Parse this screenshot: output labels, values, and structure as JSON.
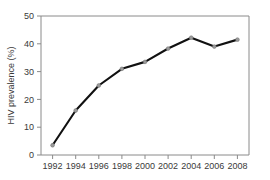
{
  "chart_data": {
    "type": "line",
    "title": "",
    "xlabel": "",
    "ylabel": "HIV prevalence (%)",
    "categories": [
      "1992",
      "1994",
      "1996",
      "1998",
      "2000",
      "2002",
      "2004",
      "2006",
      "2008"
    ],
    "x": [
      1992,
      1994,
      1996,
      1998,
      2000,
      2002,
      2004,
      2006,
      2008
    ],
    "values": [
      3.5,
      16.0,
      25.0,
      31.0,
      33.5,
      38.3,
      42.2,
      39.0,
      41.5
    ],
    "series": [
      {
        "name": "HIV prevalence",
        "values": [
          3.5,
          16.0,
          25.0,
          31.0,
          33.5,
          38.3,
          42.2,
          39.0,
          41.5
        ],
        "line_color": "#111111",
        "marker_color": "#9a9a9a",
        "marker": "circle"
      }
    ],
    "xlim": [
      1991,
      2009
    ],
    "ylim": [
      0,
      50
    ],
    "ytick_labels": [
      "0",
      "10",
      "20",
      "30",
      "40",
      "50"
    ],
    "yticks": [
      0,
      10,
      20,
      30,
      40,
      50
    ],
    "xtick_labels": [
      "1992",
      "1994",
      "1996",
      "1998",
      "2000",
      "2002",
      "2004",
      "2006",
      "2008"
    ],
    "grid": false,
    "legend": null,
    "legend_position": "none",
    "frame_color": "#8a8a8a",
    "background_color": "#ffffff"
  }
}
